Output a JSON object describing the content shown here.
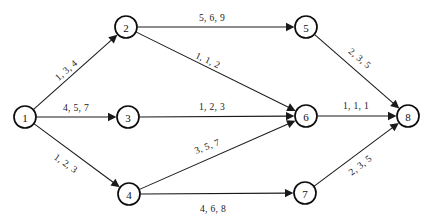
{
  "diagram": {
    "type": "directed-graph",
    "node_radius": 11,
    "colors": {
      "background": "#ffffff",
      "node_stroke": "#0d0d0d",
      "node_fill": "#ffffff",
      "edge_stroke": "#1a1a1a",
      "text": "#111111"
    },
    "nodes": [
      {
        "id": "1",
        "label": "1",
        "x": 25,
        "y": 117
      },
      {
        "id": "2",
        "label": "2",
        "x": 126,
        "y": 27
      },
      {
        "id": "3",
        "label": "3",
        "x": 128,
        "y": 117
      },
      {
        "id": "4",
        "label": "4",
        "x": 129,
        "y": 194
      },
      {
        "id": "5",
        "label": "5",
        "x": 306,
        "y": 27
      },
      {
        "id": "6",
        "label": "6",
        "x": 306,
        "y": 116
      },
      {
        "id": "7",
        "label": "7",
        "x": 305,
        "y": 193
      },
      {
        "id": "8",
        "label": "8",
        "x": 408,
        "y": 116
      }
    ],
    "edges": [
      {
        "id": "e1-2",
        "from": "1",
        "to": "2",
        "label": "1, 3, 4",
        "label_x": 66,
        "label_y": 70,
        "label_rotate": -41
      },
      {
        "id": "e1-3",
        "from": "1",
        "to": "3",
        "label": "4, 5, 7",
        "label_x": 76,
        "label_y": 107,
        "label_rotate": 0
      },
      {
        "id": "e1-4",
        "from": "1",
        "to": "4",
        "label": "1, 2, 3",
        "label_x": 66,
        "label_y": 163,
        "label_rotate": 35
      },
      {
        "id": "e2-5",
        "from": "2",
        "to": "5",
        "label": "5, 6, 9",
        "label_x": 212,
        "label_y": 17,
        "label_rotate": 0
      },
      {
        "id": "e2-6",
        "from": "2",
        "to": "6",
        "label": "1, 1, 2",
        "label_x": 208,
        "label_y": 60,
        "label_rotate": 25
      },
      {
        "id": "e3-6",
        "from": "3",
        "to": "6",
        "label": "1, 2, 3",
        "label_x": 212,
        "label_y": 106,
        "label_rotate": 0
      },
      {
        "id": "e4-6",
        "from": "4",
        "to": "6",
        "label": "3, 5, 7",
        "label_x": 207,
        "label_y": 146,
        "label_rotate": -21
      },
      {
        "id": "e4-7",
        "from": "4",
        "to": "7",
        "label": "4, 6, 8",
        "label_x": 213,
        "label_y": 208,
        "label_rotate": 0
      },
      {
        "id": "e5-8",
        "from": "5",
        "to": "8",
        "label": "2, 3, 5",
        "label_x": 360,
        "label_y": 58,
        "label_rotate": 40
      },
      {
        "id": "e6-8",
        "from": "6",
        "to": "8",
        "label": "1, 1, 1",
        "label_x": 356,
        "label_y": 105,
        "label_rotate": 0
      },
      {
        "id": "e7-8",
        "from": "7",
        "to": "8",
        "label": "2, 3, 5",
        "label_x": 360,
        "label_y": 165,
        "label_rotate": -38
      }
    ]
  }
}
